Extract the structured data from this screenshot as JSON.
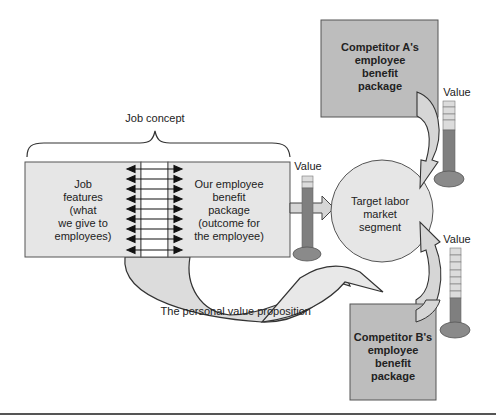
{
  "diagram": {
    "brace_label": "Job concept",
    "job_features": {
      "lines": [
        "Job",
        "features",
        "(what",
        "we give to",
        "employees)"
      ]
    },
    "our_package": {
      "lines": [
        "Our employee",
        "benefit",
        "package",
        "(outcome for",
        "the employee)"
      ]
    },
    "exchange_arrow_rows": 9,
    "target": {
      "lines": [
        "Target labor",
        "market",
        "segment"
      ]
    },
    "competitor_a": {
      "lines": [
        "Competitor A's",
        "employee",
        "benefit",
        "package"
      ]
    },
    "competitor_b": {
      "lines": [
        "Competitor B's",
        "employee",
        "benefit",
        "package"
      ]
    },
    "value_gauges": [
      {
        "id": "our",
        "label": "Value",
        "segments_total": 8,
        "segments_filled": 6
      },
      {
        "id": "competitor_a",
        "label": "Value",
        "segments_total": 8,
        "segments_filled": 5
      },
      {
        "id": "competitor_b",
        "label": "Value",
        "segments_total": 10,
        "segments_filled": 3
      }
    ],
    "swoosh_label": "The personal value proposition",
    "colors": {
      "box_light": "#e6e6e6",
      "box_dark": "#bdbdbd",
      "gauge_fill": "#7f7f7f",
      "gauge_empty": "#d9d9d9",
      "bulb": "#8a8a8a",
      "arrow_fill": "#dcdcdc",
      "stroke": "#333333"
    }
  }
}
